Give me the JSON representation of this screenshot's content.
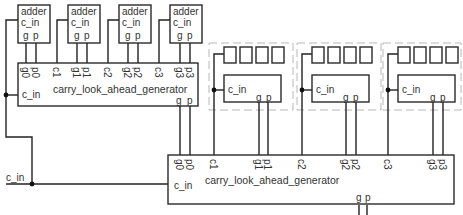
{
  "diagram": {
    "type": "carry look-ahead adder hierarchy",
    "colors": {
      "stroke": "#2a2a2a",
      "dashed_group": "#b8b8b8",
      "text": "#333333",
      "background": "#ffffff"
    },
    "top_adders": [
      {
        "title": "adder",
        "cin": "c_in",
        "g": "g",
        "p": "p"
      },
      {
        "title": "adder",
        "cin": "c_in",
        "g": "g",
        "p": "p"
      },
      {
        "title": "adder",
        "cin": "c_in",
        "g": "g",
        "p": "p"
      },
      {
        "title": "adder",
        "cin": "c_in",
        "g": "g",
        "p": "p"
      }
    ],
    "top_generator": {
      "title": "carry_look_ahead_generator",
      "cin": "c_in",
      "pins": [
        "g0",
        "p0",
        "c1",
        "g1",
        "p1",
        "c2",
        "g2",
        "p2",
        "c3",
        "g3",
        "p3"
      ],
      "out_g": "g",
      "out_p": "p"
    },
    "group_blocks": [
      {
        "cin": "c_in",
        "g": "g",
        "p": "p"
      },
      {
        "cin": "c_in",
        "g": "g",
        "p": "p"
      },
      {
        "cin": "c_in",
        "g": "g",
        "p": "p"
      }
    ],
    "bottom_generator": {
      "title": "carry_look_ahead_generator",
      "cin": "c_in",
      "pins": [
        "g0",
        "p0",
        "c1",
        "g1",
        "p1",
        "c2",
        "g2",
        "p2",
        "c3",
        "g3",
        "p3"
      ],
      "out_g": "g",
      "out_p": "p"
    },
    "external_input": "c_in"
  }
}
